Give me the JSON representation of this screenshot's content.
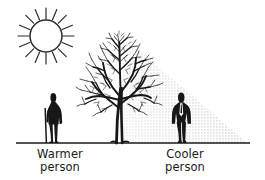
{
  "illustration": {
    "title": "Tree shade comfort illustration",
    "ink_color": "#1a1a1a",
    "shade_color": "#c9c9c9",
    "background_color": "#ffffff",
    "elements": {
      "sun": {
        "name": "sun",
        "center_x": 46,
        "center_y": 36,
        "radius": 16,
        "ray_count": 16,
        "ray_outer_radius": 27
      },
      "tree": {
        "name": "bare deciduous tree",
        "trunk_x": 119,
        "base_y": 143,
        "top_y": 33,
        "canopy_left": 83,
        "canopy_right": 152
      },
      "shade": {
        "name": "tree shade triangle",
        "apex_x": 122,
        "apex_y": 36,
        "ground_y": 143,
        "right_extent_x": 246,
        "pattern": "stipple-dots"
      },
      "ground_line": {
        "name": "ground line",
        "x1": 16,
        "x2": 250,
        "y": 143
      },
      "person_warmer": {
        "name": "person standing in sunlight with walking stick",
        "x": 53,
        "head_y": 93,
        "feet_y": 143,
        "in_shade": false
      },
      "person_cooler": {
        "name": "person standing in tree shade",
        "x": 181,
        "head_y": 93,
        "feet_y": 143,
        "in_shade": true
      }
    }
  },
  "labels": {
    "warmer": {
      "line1": "Warmer",
      "line2": "person"
    },
    "cooler": {
      "line1": "Cooler",
      "line2": "person"
    }
  }
}
